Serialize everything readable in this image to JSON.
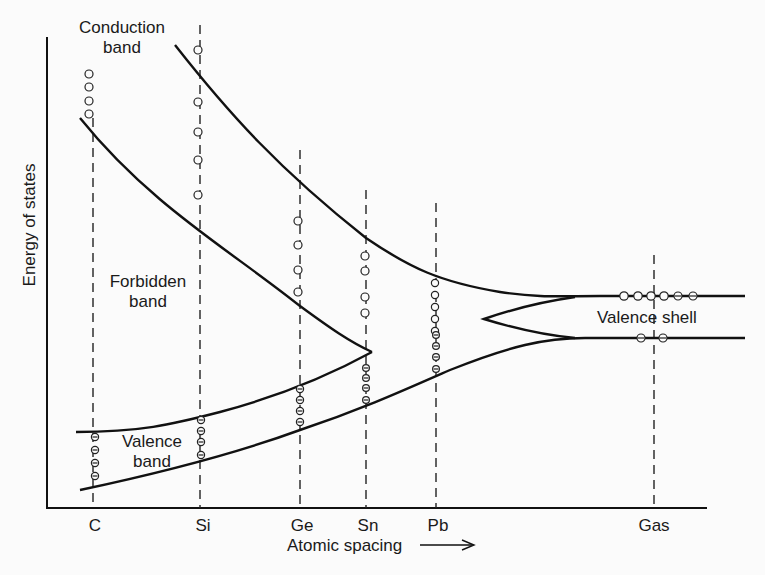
{
  "figure": {
    "y_axis_label": "Energy of states",
    "x_axis_label": "Atomic spacing",
    "x_axis_arrow": "→",
    "region_labels": {
      "conduction_band": [
        "Conduction",
        "band"
      ],
      "forbidden_band": [
        "Forbidden",
        "band"
      ],
      "valence_band": [
        "Valence",
        "band"
      ],
      "valence_shell": "Valence shell"
    },
    "elements": [
      {
        "symbol": "C",
        "x": 93
      },
      {
        "symbol": "Si",
        "x": 200
      },
      {
        "symbol": "Ge",
        "x": 300
      },
      {
        "symbol": "Sn",
        "x": 366
      },
      {
        "symbol": "Pb",
        "x": 436
      },
      {
        "symbol": "Gas",
        "x": 654
      }
    ],
    "legend_glyphs": {
      "empty_state": "circle (unoccupied state)",
      "electron": "circle with minus sign (electron)"
    },
    "colors": {
      "ink": "#111111",
      "paper": "#fbfbfb"
    }
  }
}
